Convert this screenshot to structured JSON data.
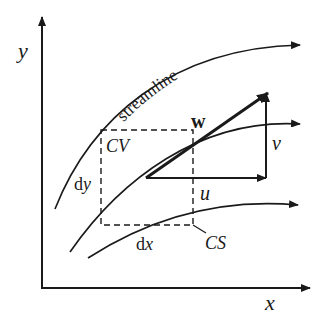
{
  "diagram": {
    "axes": {
      "x_label": "x",
      "y_label": "y"
    },
    "streamline_label": "streamline",
    "control_volume_label": "CV",
    "control_surface_label": "CS",
    "dimensions": {
      "dx": "d",
      "dx_var": "x",
      "dy": "d",
      "dy_var": "y"
    },
    "vectors": {
      "resultant": "w",
      "horizontal": "u",
      "vertical": "v"
    },
    "colors": {
      "line": "#1a1a1a",
      "background": "#ffffff"
    }
  }
}
